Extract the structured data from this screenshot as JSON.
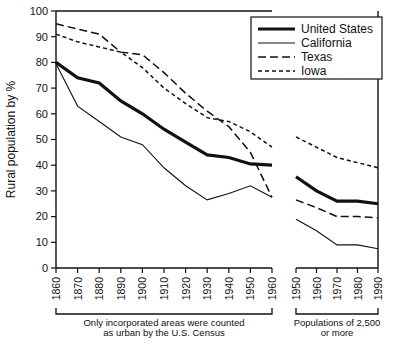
{
  "chart_data": {
    "type": "line",
    "title": "",
    "xlabel": "",
    "ylabel": "Rural population by %",
    "ylim": [
      0,
      100
    ],
    "ytick_values": [
      0,
      10,
      20,
      30,
      40,
      50,
      60,
      70,
      80,
      90,
      100
    ],
    "grid": false,
    "legend_position": "top-right",
    "legend_entries": [
      "United States",
      "California",
      "Texas",
      "Iowa"
    ],
    "panels": [
      {
        "name": "left-panel",
        "caption": "Only incorporated areas were counted as urban by the U.S. Census",
        "caption_line1": "Only incorporated areas were counted",
        "caption_line2": "as urban by the U.S. Census",
        "x": [
          1860,
          1870,
          1880,
          1890,
          1900,
          1910,
          1920,
          1930,
          1940,
          1950,
          1960
        ],
        "xtick_labels": [
          "1860",
          "1870",
          "1880",
          "1890",
          "1900",
          "1910",
          "1920",
          "1930",
          "1940",
          "1950",
          "1960"
        ],
        "series": [
          {
            "name": "United States",
            "style": "thick-solid",
            "values": [
              80,
              74,
              72,
              65,
              60,
              54,
              49,
              44,
              43,
              40.5,
              40
            ]
          },
          {
            "name": "California",
            "style": "thin-solid",
            "values": [
              79.5,
              63,
              57,
              51,
              48,
              39,
              32,
              26.5,
              29,
              32,
              27.5
            ]
          },
          {
            "name": "Texas",
            "style": "long-dash",
            "values": [
              95,
              93,
              91,
              84,
              83,
              76,
              68,
              61,
              55,
              45,
              27.5
            ]
          },
          {
            "name": "Iowa",
            "style": "short-dash",
            "values": [
              91,
              88,
              86,
              84,
              78,
              70,
              64,
              58.5,
              57,
              53,
              47
            ]
          }
        ]
      },
      {
        "name": "right-panel",
        "caption": "Populations of 2,500 or more",
        "caption_line1": "Populations of 2,500",
        "caption_line2": "or more",
        "x": [
          1950,
          1960,
          1970,
          1980,
          1990
        ],
        "xtick_labels": [
          "1950",
          "1960",
          "1970",
          "1980",
          "1990"
        ],
        "series": [
          {
            "name": "United States",
            "style": "thick-solid",
            "values": [
              35.5,
              30,
              26,
              26,
              25
            ]
          },
          {
            "name": "California",
            "style": "thin-solid",
            "values": [
              19,
              14.5,
              9,
              9,
              7.5
            ]
          },
          {
            "name": "Texas",
            "style": "long-dash",
            "values": [
              26.5,
              23.5,
              20,
              20,
              19.5
            ]
          },
          {
            "name": "Iowa",
            "style": "short-dash",
            "values": [
              51,
              47,
              43,
              41,
              39
            ]
          }
        ]
      }
    ]
  },
  "colors": {
    "ink": "#111111",
    "background": "#ffffff"
  }
}
